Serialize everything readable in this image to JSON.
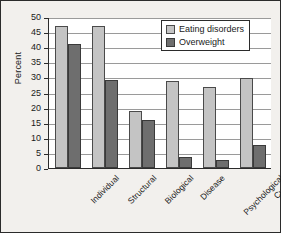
{
  "chart_data": {
    "type": "bar",
    "title": "",
    "xlabel": "",
    "ylabel": "Percent",
    "ylim": [
      0,
      50
    ],
    "yticks": [
      0,
      5,
      10,
      15,
      20,
      25,
      30,
      35,
      40,
      45,
      50
    ],
    "grid": true,
    "legend_position": "top-right",
    "categories": [
      "Individual",
      "Structural",
      "Biological",
      "Disease",
      "Psychological",
      "Cultural"
    ],
    "series": [
      {
        "name": "Eating disorders",
        "color": "#c4c4c4",
        "values": [
          47,
          47,
          19,
          28.7,
          26.7,
          29.7
        ]
      },
      {
        "name": "Overweight",
        "color": "#6e6e6e",
        "values": [
          41,
          29,
          15.8,
          3.7,
          2.8,
          7.5
        ]
      }
    ]
  },
  "legend": {
    "items": [
      {
        "label": "Eating disorders",
        "swatch": "s0"
      },
      {
        "label": "Overweight",
        "swatch": "s1"
      }
    ]
  },
  "colors": {
    "background": "#f2f0ed",
    "plot_background": "#ffffff",
    "axis": "#2b2b2b",
    "grid": "#9a9a9a",
    "series_light": "#c4c4c4",
    "series_dark": "#6e6e6e"
  }
}
